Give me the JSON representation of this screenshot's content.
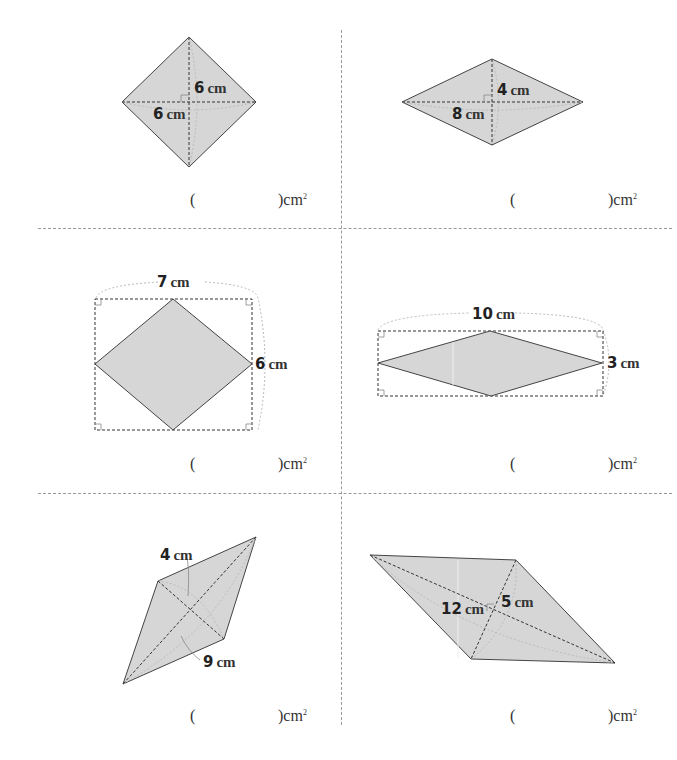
{
  "worksheet": {
    "unit": "cm",
    "answer_unit": "cm",
    "answer_unit_power": "2",
    "problems": [
      {
        "id": 1,
        "labels": [
          {
            "value": "6",
            "unit": "cm"
          },
          {
            "value": "6",
            "unit": "cm"
          }
        ]
      },
      {
        "id": 2,
        "labels": [
          {
            "value": "4",
            "unit": "cm"
          },
          {
            "value": "8",
            "unit": "cm"
          }
        ]
      },
      {
        "id": 3,
        "labels": [
          {
            "value": "7",
            "unit": "cm"
          },
          {
            "value": "6",
            "unit": "cm"
          }
        ]
      },
      {
        "id": 4,
        "labels": [
          {
            "value": "10",
            "unit": "cm"
          },
          {
            "value": "3",
            "unit": "cm"
          }
        ]
      },
      {
        "id": 5,
        "labels": [
          {
            "value": "4",
            "unit": "cm"
          },
          {
            "value": "9",
            "unit": "cm"
          }
        ]
      },
      {
        "id": 6,
        "labels": [
          {
            "value": "12",
            "unit": "cm"
          },
          {
            "value": "5",
            "unit": "cm"
          }
        ]
      }
    ],
    "answer_open": "(",
    "answer_close": ")cm"
  },
  "colors": {
    "fill": "#d6d6d6",
    "stroke": "#444444",
    "dash": "#333333",
    "guide": "#bbbbbb"
  }
}
